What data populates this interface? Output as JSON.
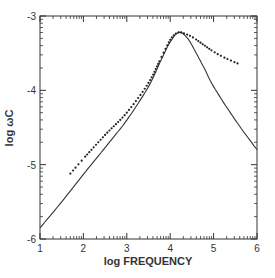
{
  "chart_data": {
    "type": "line",
    "title": "",
    "xlabel": "log FREQUENCY",
    "ylabel": "log ωC",
    "xlim": [
      1,
      6
    ],
    "ylim": [
      -6,
      -3
    ],
    "xticks": [
      1,
      2,
      3,
      4,
      5,
      6
    ],
    "yticks": [
      -3,
      -4,
      -5,
      -6
    ],
    "xtick_labels": [
      "1",
      "2",
      "3",
      "4",
      "5",
      "6"
    ],
    "ytick_labels": [
      "-3",
      "-4",
      "-5",
      "-6"
    ],
    "grid": false,
    "legend": null,
    "series": [
      {
        "name": "theoretical (solid line)",
        "style": "solid",
        "x": [
          1.0,
          1.5,
          2.0,
          2.5,
          3.0,
          3.5,
          3.8,
          4.0,
          4.2,
          4.4,
          4.6,
          4.8,
          5.0,
          5.5,
          6.0
        ],
        "y": [
          -5.85,
          -5.5,
          -5.13,
          -4.77,
          -4.4,
          -3.95,
          -3.58,
          -3.35,
          -3.22,
          -3.3,
          -3.5,
          -3.72,
          -3.95,
          -4.4,
          -4.8
        ]
      },
      {
        "name": "measured (dotted)",
        "style": "dotted",
        "x": [
          1.7,
          2.0,
          2.5,
          3.0,
          3.5,
          3.8,
          4.0,
          4.1,
          4.2,
          4.3,
          4.5,
          4.75,
          5.0,
          5.25,
          5.6
        ],
        "y": [
          -5.12,
          -4.92,
          -4.6,
          -4.3,
          -3.9,
          -3.55,
          -3.32,
          -3.25,
          -3.22,
          -3.23,
          -3.28,
          -3.38,
          -3.48,
          -3.56,
          -3.65
        ]
      }
    ]
  },
  "labels": {
    "xlabel": "log FREQUENCY",
    "ylabel": "log ωC"
  }
}
